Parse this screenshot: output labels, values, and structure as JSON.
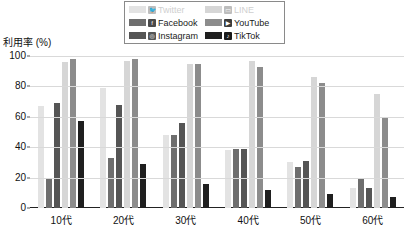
{
  "chart_data": {
    "type": "bar",
    "title": "",
    "xlabel": "",
    "ylabel": "利用率 (%)",
    "ylim": [
      0,
      100
    ],
    "yticks": [
      "0",
      "20",
      "40",
      "60",
      "80",
      "100"
    ],
    "ytick_values": [
      0,
      20,
      40,
      60,
      80,
      100
    ],
    "grid": true,
    "legend_position": "top-center",
    "categories": [
      "10代",
      "20代",
      "30代",
      "40代",
      "50代",
      "60代"
    ],
    "series": [
      {
        "name": "Twitter",
        "icon": "twitter-bird-icon",
        "color": "#e3e3e3",
        "values": [
          67,
          79,
          48,
          38,
          30,
          13
        ]
      },
      {
        "name": "Facebook",
        "icon": "facebook-f-icon",
        "color": "#6e6e6e",
        "values": [
          19,
          33,
          48,
          39,
          27,
          19
        ]
      },
      {
        "name": "Instagram",
        "icon": "instagram-icon",
        "color": "#555555",
        "values": [
          69,
          68,
          56,
          39,
          31,
          13
        ]
      },
      {
        "name": "LINE",
        "icon": "line-chat-icon",
        "color": "#d6d6d6",
        "values": [
          96,
          97,
          95,
          97,
          86,
          75
        ]
      },
      {
        "name": "YouTube",
        "icon": "youtube-play-icon",
        "color": "#8c8c8c",
        "values": [
          98,
          98,
          95,
          93,
          82,
          59
        ]
      },
      {
        "name": "TikTok",
        "icon": "tiktok-note-icon",
        "color": "#1f1f1f",
        "values": [
          57,
          29,
          16,
          12,
          9,
          7
        ]
      }
    ]
  },
  "legend": {
    "items": [
      {
        "label": "Twitter",
        "swatch": "#e3e3e3",
        "badge_bg": "#bdbdbd",
        "badge_fg": "#ffffff",
        "glyph": "🐦",
        "icon": "twitter-bird-icon"
      },
      {
        "label": "LINE",
        "swatch": "#d6d6d6",
        "badge_bg": "#bdbdbd",
        "badge_fg": "#ffffff",
        "glyph": "▭",
        "icon": "line-chat-icon"
      },
      {
        "label": "Facebook",
        "swatch": "#6e6e6e",
        "badge_bg": "#4a4a4a",
        "badge_fg": "#ffffff",
        "glyph": "f",
        "icon": "facebook-f-icon"
      },
      {
        "label": "YouTube",
        "swatch": "#8c8c8c",
        "badge_bg": "#3d3d3d",
        "badge_fg": "#ffffff",
        "glyph": "▶",
        "icon": "youtube-play-icon"
      },
      {
        "label": "Instagram",
        "swatch": "#555555",
        "badge_bg": "#565656",
        "badge_fg": "#ffffff",
        "glyph": "◎",
        "icon": "instagram-icon"
      },
      {
        "label": "TikTok",
        "swatch": "#1f1f1f",
        "badge_bg": "#1a1a1a",
        "badge_fg": "#ffffff",
        "glyph": "♪",
        "icon": "tiktok-note-icon"
      }
    ]
  },
  "axis": {
    "y_title": "利用率 (%)"
  }
}
